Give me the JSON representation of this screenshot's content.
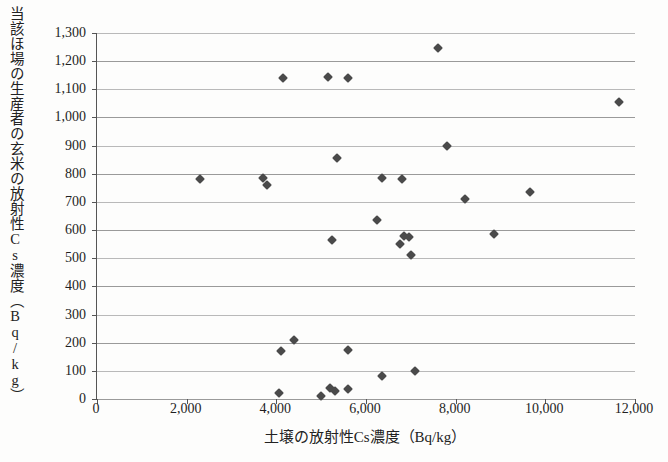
{
  "chart_data": {
    "type": "scatter",
    "title": "",
    "xlabel": "土壌の放射性Cs濃度（Bq/kg）",
    "ylabel": "当該ほ場の生産者の玄米の放射性Cs濃度（Bq/kg）",
    "xlim": [
      0,
      12000
    ],
    "ylim": [
      0,
      1300
    ],
    "xticks": [
      "0",
      "2,000",
      "4,000",
      "6,000",
      "8,000",
      "10,000",
      "12,000"
    ],
    "xtick_values": [
      0,
      2000,
      4000,
      6000,
      8000,
      10000,
      12000
    ],
    "yticks": [
      "0",
      "100",
      "200",
      "300",
      "400",
      "500",
      "600",
      "700",
      "800",
      "900",
      "1,000",
      "1,100",
      "1,200",
      "1,300"
    ],
    "ytick_values": [
      0,
      100,
      200,
      300,
      400,
      500,
      600,
      700,
      800,
      900,
      1000,
      1100,
      1200,
      1300
    ],
    "grid": "horizontal",
    "legend": "none",
    "marker": "diamond",
    "marker_color": "#4a4a4a",
    "points": [
      {
        "x": 2300,
        "y": 780
      },
      {
        "x": 3700,
        "y": 785
      },
      {
        "x": 3800,
        "y": 760
      },
      {
        "x": 4150,
        "y": 1140
      },
      {
        "x": 5150,
        "y": 1145
      },
      {
        "x": 5600,
        "y": 1140
      },
      {
        "x": 7600,
        "y": 1245
      },
      {
        "x": 11650,
        "y": 1055
      },
      {
        "x": 5350,
        "y": 855
      },
      {
        "x": 7800,
        "y": 900
      },
      {
        "x": 6350,
        "y": 785
      },
      {
        "x": 6800,
        "y": 780
      },
      {
        "x": 8200,
        "y": 710
      },
      {
        "x": 9650,
        "y": 735
      },
      {
        "x": 6250,
        "y": 635
      },
      {
        "x": 5250,
        "y": 565
      },
      {
        "x": 6850,
        "y": 580
      },
      {
        "x": 6950,
        "y": 575
      },
      {
        "x": 6750,
        "y": 550
      },
      {
        "x": 7000,
        "y": 510
      },
      {
        "x": 8850,
        "y": 585
      },
      {
        "x": 4100,
        "y": 170
      },
      {
        "x": 4400,
        "y": 210
      },
      {
        "x": 5600,
        "y": 175
      },
      {
        "x": 6350,
        "y": 80
      },
      {
        "x": 7100,
        "y": 100
      },
      {
        "x": 4050,
        "y": 20
      },
      {
        "x": 5000,
        "y": 10
      },
      {
        "x": 5200,
        "y": 40
      },
      {
        "x": 5300,
        "y": 30
      },
      {
        "x": 5600,
        "y": 35
      }
    ]
  },
  "figure": {
    "background_color": "#fdfdfc",
    "axis_color": "#555555",
    "grid_color": "#9a9a9a"
  }
}
